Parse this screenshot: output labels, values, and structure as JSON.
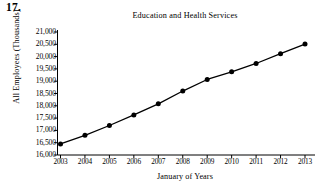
{
  "figure": {
    "number": "17."
  },
  "chart_data": {
    "type": "line",
    "title": "Education and Health Services",
    "xlabel": "January of Years",
    "ylabel": "All Employees (Thousands)",
    "x": [
      2003,
      2004,
      2005,
      2006,
      2007,
      2008,
      2009,
      2010,
      2011,
      2012,
      2013
    ],
    "xtick_labels": [
      "2003",
      "2004",
      "2005",
      "2006",
      "2007",
      "2008",
      "2009",
      "2010",
      "2011",
      "2012",
      "2013"
    ],
    "values": [
      16450,
      16800,
      17200,
      17630,
      18080,
      18600,
      19070,
      19380,
      19720,
      20120,
      20510
    ],
    "ytick_values": [
      16000,
      16500,
      17000,
      17500,
      18000,
      18500,
      19000,
      19500,
      20000,
      20500,
      21000
    ],
    "ytick_labels": [
      "16,000",
      "16,500",
      "17,000",
      "17,500",
      "18,000",
      "18,500",
      "19,000",
      "19,500",
      "20,000",
      "20,500",
      "21,000"
    ],
    "ylim": [
      16000,
      21000
    ],
    "xlim": [
      2003,
      2013
    ],
    "grid": false,
    "legend": false,
    "marker": "filled-circle",
    "line_color": "#000000",
    "marker_color": "#000000",
    "background_color": "#ffffff"
  }
}
